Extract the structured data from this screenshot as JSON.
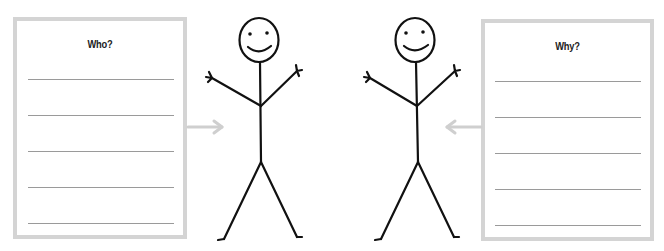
{
  "left_panel": {
    "title": "Who?",
    "line_count": 5
  },
  "right_panel": {
    "title": "Why?",
    "line_count": 5
  },
  "figures": [
    {
      "name": "left-stick-figure",
      "expression": "smile"
    },
    {
      "name": "right-stick-figure",
      "expression": "smile"
    }
  ],
  "arrows": [
    {
      "from": "left-panel",
      "to": "left-stick-figure",
      "direction": "right"
    },
    {
      "from": "right-panel",
      "to": "right-stick-figure",
      "direction": "left"
    }
  ],
  "colors": {
    "panel_border": "#d4d4d4",
    "arrow": "#cfcfcf",
    "rule_line": "#9a9a9a",
    "ink": "#111111"
  }
}
